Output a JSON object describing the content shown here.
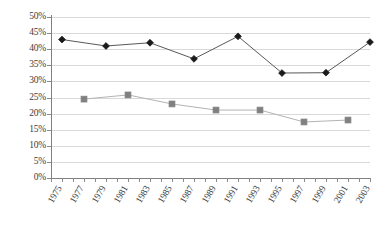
{
  "chart_data": {
    "type": "line",
    "title": "",
    "subtitle": "",
    "xlabel": "",
    "ylabel": "",
    "xlim": [
      1975,
      2004
    ],
    "ylim": [
      0,
      50
    ],
    "grid": "horizontal",
    "legend": "none",
    "y_tick_labels": [
      "0%",
      "5%",
      "10%",
      "15%",
      "20%",
      "25%",
      "30%",
      "35%",
      "40%",
      "45%",
      "50%"
    ],
    "y_tick_values": [
      0,
      5,
      10,
      15,
      20,
      25,
      30,
      35,
      40,
      45,
      50
    ],
    "y_tick_step": 5,
    "x_tick_labels": [
      "1975",
      "1977",
      "1979",
      "1981",
      "1983",
      "1985",
      "1987",
      "1989",
      "1991",
      "1993",
      "1995",
      "1997",
      "1999",
      "2001",
      "2003"
    ],
    "x_tick_values": [
      1975,
      1977,
      1979,
      1981,
      1983,
      1985,
      1987,
      1989,
      1991,
      1993,
      1995,
      1997,
      1999,
      2001,
      2003
    ],
    "x_minor_step": 1,
    "series": [
      {
        "name": "series-diamond",
        "marker": "diamond",
        "color": "#1a1a1a",
        "line_color": "#595959",
        "x": [
          1976,
          1980,
          1984,
          1988,
          1992,
          1996,
          2000,
          2004
        ],
        "values": [
          43.0,
          41.0,
          42.0,
          37.0,
          44.0,
          32.6,
          32.7,
          42.2
        ]
      },
      {
        "name": "series-square",
        "marker": "square",
        "color": "#808080",
        "line_color": "#b3b3b3",
        "x": [
          1978,
          1982,
          1986,
          1990,
          1994,
          1998,
          2002
        ],
        "values": [
          24.5,
          25.8,
          23.0,
          21.1,
          21.1,
          17.4,
          18.0
        ]
      }
    ]
  }
}
